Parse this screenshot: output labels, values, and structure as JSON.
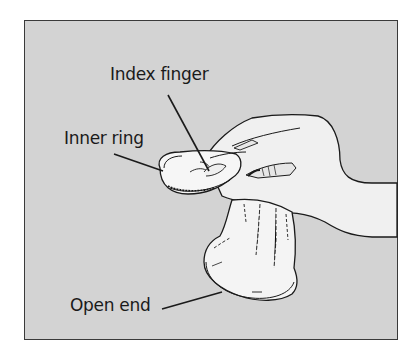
{
  "figure": {
    "type": "instructional-illustration",
    "background_color": "#d3d3d3",
    "frame_color": "#3a3a3a",
    "object_fill_color": "#f4f4f4",
    "line_color": "#1a1a1a"
  },
  "labels": {
    "index_finger": "Index finger",
    "inner_ring": "Inner ring",
    "open_end": "Open end"
  }
}
